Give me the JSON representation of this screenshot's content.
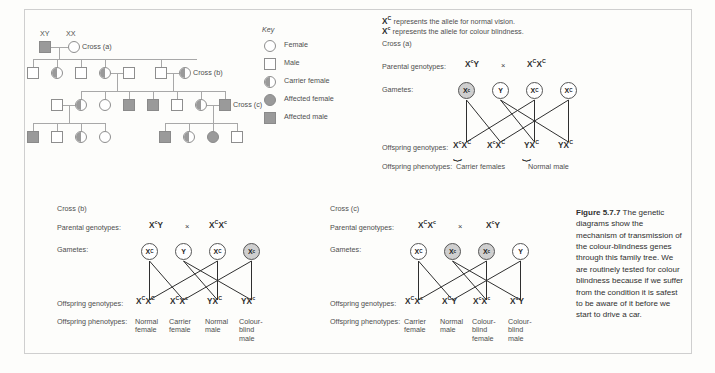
{
  "figure": {
    "caption_label": "Figure 5.7.7",
    "caption_text": " The genetic diagrams show the mechanism of transmission of the colour-blindness genes through this family tree. We are routinely tested for colour blindness because if we suffer from the condition it is safest to be aware of it before we start to drive a car."
  },
  "key": {
    "title": "Key",
    "items": [
      {
        "symbol": "circle-open",
        "label": "Female"
      },
      {
        "symbol": "square-open",
        "label": "Male"
      },
      {
        "symbol": "circle-half",
        "label": "Carrier female"
      },
      {
        "symbol": "circle-filled",
        "label": "Affected female"
      },
      {
        "symbol": "square-filled",
        "label": "Affected male"
      }
    ]
  },
  "allele_legend": {
    "line1_symbol": "XC",
    "line1_text": " represents the allele for normal vision.",
    "line2_symbol": "Xc",
    "line2_text": " represents the allele for colour blindness."
  },
  "pedigree": {
    "founder_male_label": "XY",
    "founder_female_label": "XX",
    "cross_a_label": "Cross (a)",
    "cross_b_label": "Cross (b)",
    "cross_c_label": "Cross (c)"
  },
  "row_labels": {
    "parental": "Parental genotypes:",
    "gametes": "Gametes:",
    "offspring_genotypes": "Offspring genotypes:",
    "offspring_phenotypes": "Offspring phenotypes:",
    "times": "×"
  },
  "crosses": [
    {
      "id": "a",
      "title": "Cross (a)",
      "parent_left": "XcY",
      "parent_right": "XCXC",
      "gametes": [
        {
          "label": "Xc",
          "shaded": true
        },
        {
          "label": "Y",
          "shaded": false
        },
        {
          "label": "XC",
          "shaded": false
        },
        {
          "label": "XC",
          "shaded": false
        }
      ],
      "offspring_genotypes": [
        "XcXC",
        "XcXC",
        "YXC",
        "YXC"
      ],
      "phenotype_groups": [
        {
          "label": "Carrier females",
          "span": 2
        },
        {
          "label": "Normal male",
          "span": 2
        }
      ]
    },
    {
      "id": "b",
      "title": "Cross (b)",
      "parent_left": "XCY",
      "parent_right": "XCXc",
      "gametes": [
        {
          "label": "XC",
          "shaded": false
        },
        {
          "label": "Y",
          "shaded": false
        },
        {
          "label": "XC",
          "shaded": false
        },
        {
          "label": "Xc",
          "shaded": true
        }
      ],
      "offspring_genotypes": [
        "XCXC",
        "XCXc",
        "YXC",
        "YXc"
      ],
      "phenotypes": [
        "Normal female",
        "Carrier female",
        "Normal male",
        "Colour-blind male"
      ]
    },
    {
      "id": "c",
      "title": "Cross (c)",
      "parent_left": "XCXc",
      "parent_right": "XcY",
      "gametes": [
        {
          "label": "XC",
          "shaded": false
        },
        {
          "label": "Xc",
          "shaded": true
        },
        {
          "label": "Xc",
          "shaded": true
        },
        {
          "label": "Y",
          "shaded": false
        }
      ],
      "offspring_genotypes": [
        "XCXc",
        "XCY",
        "XcXc",
        "XcY"
      ],
      "phenotypes": [
        "Carrier female",
        "Normal male",
        "Colour-blind female",
        "Colour-blind male"
      ]
    }
  ],
  "colors": {
    "affected": "#9a9a9a",
    "outline": "#8e8e8e",
    "line": "#a8a8a8",
    "text": "#4e4e4e",
    "background": "#fdfdfb",
    "border": "#cfcfcf"
  }
}
